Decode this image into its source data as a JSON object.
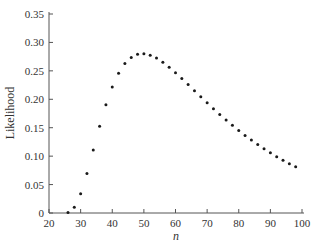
{
  "chart_data": {
    "type": "scatter",
    "title": "",
    "xlabel": "n",
    "ylabel": "Likelihood",
    "xlim": [
      20,
      100
    ],
    "ylim": [
      0,
      0.35
    ],
    "grid": false,
    "legend": null,
    "x_ticks": [
      "20",
      "30",
      "40",
      "50",
      "60",
      "70",
      "80",
      "90",
      "100"
    ],
    "y_ticks": [
      "0",
      "0.05",
      "0.10",
      "0.15",
      "0.20",
      "0.25",
      "0.30",
      "0.35"
    ],
    "marker_color": "#1a1a1a",
    "series": [
      {
        "name": "Likelihood",
        "x": [
          26,
          28,
          30,
          32,
          34,
          36,
          38,
          40,
          42,
          44,
          46,
          48,
          50,
          52,
          54,
          56,
          58,
          60,
          62,
          64,
          66,
          68,
          70,
          72,
          74,
          76,
          78,
          80,
          82,
          84,
          86,
          88,
          90,
          92,
          94,
          96,
          98
        ],
        "y": [
          0.0009,
          0.0103,
          0.0339,
          0.0694,
          0.111,
          0.1527,
          0.1903,
          0.2216,
          0.2457,
          0.2628,
          0.2737,
          0.2791,
          0.2801,
          0.2776,
          0.2724,
          0.2651,
          0.2564,
          0.2467,
          0.2364,
          0.2258,
          0.2151,
          0.2044,
          0.1939,
          0.1835,
          0.1734,
          0.1636,
          0.1542,
          0.1451,
          0.1365,
          0.1282,
          0.1204,
          0.1129,
          0.1058,
          0.0991,
          0.0928,
          0.0868,
          0.0813
        ]
      }
    ]
  }
}
